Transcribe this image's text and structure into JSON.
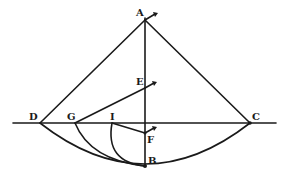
{
  "figure": {
    "labels": {
      "A": "A",
      "B": "B",
      "C": "C",
      "D": "D",
      "E": "E",
      "F": "F",
      "G": "G",
      "I": "I"
    },
    "points": {
      "A": [
        145,
        20
      ],
      "B": [
        145,
        166
      ],
      "C": [
        250,
        123
      ],
      "D": [
        40,
        123
      ],
      "E": [
        145,
        88
      ],
      "F": [
        145,
        133
      ],
      "G": [
        75,
        123
      ],
      "I": [
        112,
        123
      ]
    },
    "segments": [
      [
        "A",
        "D"
      ],
      [
        "A",
        "C"
      ],
      [
        "A",
        "B"
      ],
      [
        "D",
        "C"
      ],
      [
        "E",
        "G"
      ],
      [
        "I",
        "F"
      ]
    ],
    "arcs": [
      [
        "D",
        "B",
        "C"
      ],
      [
        "G",
        "B"
      ],
      [
        "I",
        "B"
      ]
    ],
    "colors": {
      "ink": "#1a1a1a",
      "paper": "#ffffff"
    }
  }
}
